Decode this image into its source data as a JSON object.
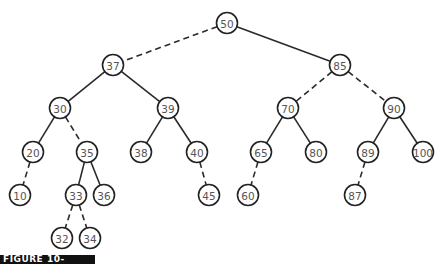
{
  "diagram": {
    "type": "binary-search-tree",
    "colors": {
      "background": "#ffffff",
      "stroke": "#222222",
      "label": "#555555",
      "caption_bar": "#111111"
    },
    "node_radius": 10.5,
    "nodes": [
      {
        "id": "n50",
        "label": "50",
        "x": 227,
        "y": 23
      },
      {
        "id": "n37",
        "label": "37",
        "x": 113,
        "y": 65
      },
      {
        "id": "n85",
        "label": "85",
        "x": 340,
        "y": 65
      },
      {
        "id": "n30",
        "label": "30",
        "x": 60,
        "y": 108
      },
      {
        "id": "n39",
        "label": "39",
        "x": 168,
        "y": 108
      },
      {
        "id": "n70",
        "label": "70",
        "x": 288,
        "y": 108
      },
      {
        "id": "n90",
        "label": "90",
        "x": 394,
        "y": 108
      },
      {
        "id": "n20",
        "label": "20",
        "x": 33,
        "y": 152
      },
      {
        "id": "n35",
        "label": "35",
        "x": 87,
        "y": 152
      },
      {
        "id": "n38",
        "label": "38",
        "x": 141,
        "y": 152
      },
      {
        "id": "n40",
        "label": "40",
        "x": 197,
        "y": 152
      },
      {
        "id": "n65",
        "label": "65",
        "x": 261,
        "y": 152
      },
      {
        "id": "n80",
        "label": "80",
        "x": 316,
        "y": 152
      },
      {
        "id": "n89",
        "label": "89",
        "x": 368,
        "y": 152
      },
      {
        "id": "n100",
        "label": "100",
        "x": 423,
        "y": 152
      },
      {
        "id": "n10",
        "label": "10",
        "x": 20,
        "y": 195
      },
      {
        "id": "n33",
        "label": "33",
        "x": 76,
        "y": 195
      },
      {
        "id": "n36",
        "label": "36",
        "x": 104,
        "y": 195
      },
      {
        "id": "n45",
        "label": "45",
        "x": 209,
        "y": 195
      },
      {
        "id": "n60",
        "label": "60",
        "x": 248,
        "y": 195
      },
      {
        "id": "n87",
        "label": "87",
        "x": 355,
        "y": 195
      },
      {
        "id": "n32",
        "label": "32",
        "x": 62,
        "y": 238
      },
      {
        "id": "n34",
        "label": "34",
        "x": 90,
        "y": 238
      }
    ],
    "edges": [
      {
        "from": "n50",
        "to": "n37",
        "style": "dashed"
      },
      {
        "from": "n50",
        "to": "n85",
        "style": "solid"
      },
      {
        "from": "n37",
        "to": "n30",
        "style": "solid"
      },
      {
        "from": "n37",
        "to": "n39",
        "style": "solid"
      },
      {
        "from": "n85",
        "to": "n70",
        "style": "dashed"
      },
      {
        "from": "n85",
        "to": "n90",
        "style": "dashed"
      },
      {
        "from": "n30",
        "to": "n20",
        "style": "solid"
      },
      {
        "from": "n30",
        "to": "n35",
        "style": "dashed"
      },
      {
        "from": "n39",
        "to": "n38",
        "style": "solid"
      },
      {
        "from": "n39",
        "to": "n40",
        "style": "solid"
      },
      {
        "from": "n70",
        "to": "n65",
        "style": "solid"
      },
      {
        "from": "n70",
        "to": "n80",
        "style": "solid"
      },
      {
        "from": "n90",
        "to": "n89",
        "style": "solid"
      },
      {
        "from": "n90",
        "to": "n100",
        "style": "solid"
      },
      {
        "from": "n20",
        "to": "n10",
        "style": "dashed"
      },
      {
        "from": "n35",
        "to": "n33",
        "style": "solid"
      },
      {
        "from": "n35",
        "to": "n36",
        "style": "solid"
      },
      {
        "from": "n40",
        "to": "n45",
        "style": "dashed"
      },
      {
        "from": "n65",
        "to": "n60",
        "style": "dashed"
      },
      {
        "from": "n89",
        "to": "n87",
        "style": "dashed"
      },
      {
        "from": "n33",
        "to": "n32",
        "style": "dashed"
      },
      {
        "from": "n33",
        "to": "n34",
        "style": "dashed"
      }
    ]
  },
  "caption": {
    "text": "FIGURE 10-"
  }
}
